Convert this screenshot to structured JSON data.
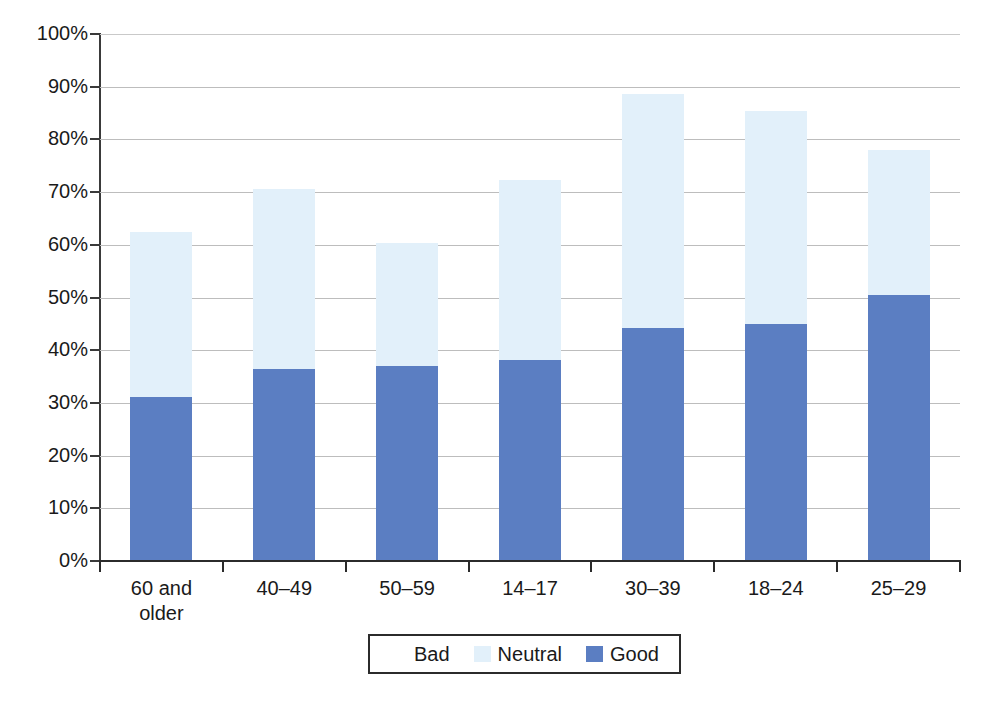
{
  "chart_data": {
    "type": "bar",
    "subtype": "stacked-percentage",
    "title": "",
    "subtitle": "",
    "xlabel": "",
    "ylabel": "",
    "categories": [
      "60 and older",
      "40–49",
      "50–59",
      "14–17",
      "30–39",
      "18–24",
      "25–29"
    ],
    "category_lines": [
      [
        "60 and",
        "older"
      ],
      [
        "40–49"
      ],
      [
        "50–59"
      ],
      [
        "14–17"
      ],
      [
        "30–39"
      ],
      [
        "18–24"
      ],
      [
        "25–29"
      ]
    ],
    "series": [
      {
        "name": "Good",
        "color": "#5b7ec2",
        "values": [
          31.2,
          36.4,
          37.0,
          38.2,
          44.2,
          44.9,
          50.5
        ]
      },
      {
        "name": "Neutral",
        "color": "#e2f0fa",
        "values": [
          31.2,
          34.1,
          23.3,
          34.1,
          44.4,
          40.5,
          27.5
        ]
      },
      {
        "name": "Bad",
        "color": "#ffffff",
        "values": [
          37.6,
          29.5,
          39.7,
          27.7,
          11.4,
          14.6,
          22.0
        ]
      }
    ],
    "stack_tops": {
      "good": [
        31.2,
        36.4,
        37.0,
        38.2,
        44.2,
        44.9,
        50.5
      ],
      "good_plus_neutral": [
        62.4,
        70.5,
        60.3,
        72.3,
        88.6,
        85.4,
        78.0
      ]
    },
    "ylim": [
      0,
      100
    ],
    "y_ticks": [
      "0%",
      "10%",
      "20%",
      "30%",
      "40%",
      "50%",
      "60%",
      "70%",
      "80%",
      "90%",
      "100%"
    ],
    "y_tick_values": [
      0,
      10,
      20,
      30,
      40,
      50,
      60,
      70,
      80,
      90,
      100
    ],
    "grid": "horizontal",
    "legend_position": "bottom",
    "legend": [
      {
        "label": "Bad",
        "color": "#ffffff"
      },
      {
        "label": "Neutral",
        "color": "#e2f0fa"
      },
      {
        "label": "Good",
        "color": "#5b7ec2"
      }
    ],
    "colors": {
      "good": "#5b7ec2",
      "neutral": "#e2f0fa",
      "bad": "#ffffff",
      "axis": "#2b2b2b",
      "grid": "#bdbdbd",
      "text": "#1a1a1a",
      "background": "#ffffff"
    }
  }
}
